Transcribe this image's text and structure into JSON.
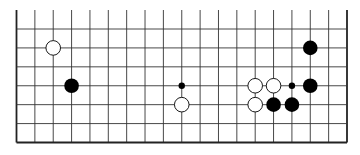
{
  "board": {
    "size": 19,
    "visible_rows": 7,
    "edges": {
      "left": true,
      "right": true,
      "bottom": true,
      "top": false
    },
    "colors": {
      "line": "#333333",
      "edge": "#222222",
      "black": "#000000",
      "white": "#ffffff",
      "background": "#ffffff"
    },
    "star_points": [
      {
        "col": 3,
        "row": 3
      },
      {
        "col": 9,
        "row": 3
      },
      {
        "col": 15,
        "row": 3
      }
    ],
    "stones": [
      {
        "color": "white",
        "col": 2,
        "row": 1
      },
      {
        "color": "black",
        "col": 3,
        "row": 3
      },
      {
        "color": "white",
        "col": 9,
        "row": 4
      },
      {
        "color": "black",
        "col": 16,
        "row": 1
      },
      {
        "color": "white",
        "col": 13,
        "row": 3
      },
      {
        "color": "white",
        "col": 14,
        "row": 3
      },
      {
        "color": "black",
        "col": 16,
        "row": 3
      },
      {
        "color": "white",
        "col": 13,
        "row": 4
      },
      {
        "color": "black",
        "col": 14,
        "row": 4
      },
      {
        "color": "black",
        "col": 15,
        "row": 4
      }
    ]
  }
}
